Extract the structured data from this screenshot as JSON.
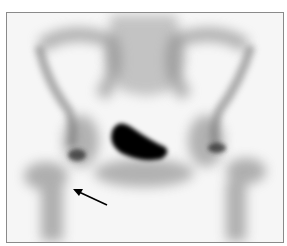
{
  "image": {
    "description": "Anterior bone scintigraphy of the pelvis with arrow indicating region near right hip",
    "frame_color": "#8a8a8a",
    "background": "#f7f7f7",
    "uptake_color": "#000000"
  },
  "annotations": {
    "arrow": {
      "from": [
        106,
        204
      ],
      "to": [
        73,
        189
      ],
      "color": "#000000"
    }
  }
}
